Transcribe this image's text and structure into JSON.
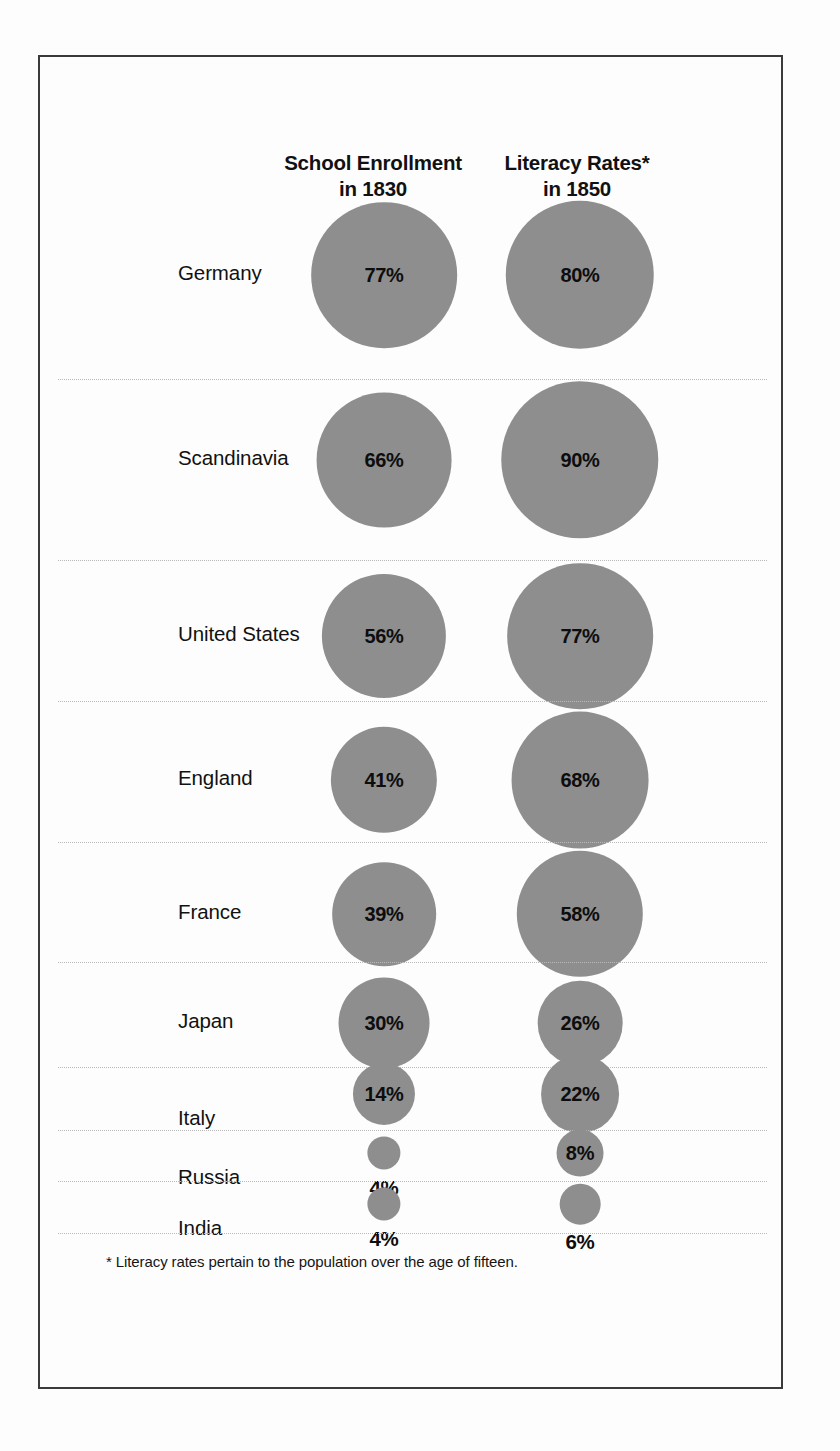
{
  "chart_data": {
    "type": "bar",
    "subtype": "bubble-matrix",
    "title": "",
    "xlabel": "",
    "ylabel": "",
    "grid": false,
    "legend_position": "none",
    "columns": [
      {
        "key": "enrollment",
        "label_line1": "School Enrollment",
        "label_line2": "in 1830",
        "unit": "%"
      },
      {
        "key": "literacy",
        "label_line1": "Literacy Rates*",
        "label_line2": "in 1850",
        "unit": "%"
      }
    ],
    "categories": [
      "Germany",
      "Scandinavia",
      "United States",
      "England",
      "France",
      "Japan",
      "Italy",
      "Russia",
      "India"
    ],
    "series": [
      {
        "name": "School Enrollment in 1830",
        "values": [
          77,
          66,
          56,
          41,
          39,
          30,
          14,
          4,
          4
        ]
      },
      {
        "name": "Literacy Rates* in 1850",
        "values": [
          80,
          90,
          77,
          68,
          58,
          26,
          22,
          8,
          6
        ]
      }
    ],
    "value_labels": {
      "enrollment": [
        "77%",
        "66%",
        "56%",
        "41%",
        "39%",
        "30%",
        "14%",
        "4%",
        "4%"
      ],
      "literacy": [
        "80%",
        "90%",
        "77%",
        "68%",
        "58%",
        "26%",
        "22%",
        "8%",
        "6%"
      ]
    },
    "annotations": [
      "* Literacy rates pertain to the population over the age of fifteen."
    ],
    "marker_color": "#8e8e8e",
    "area_encoding": "circle diameter proportional to square root of percentage"
  },
  "header": {
    "enrollment": {
      "line1": "School Enrollment",
      "line2": "in 1830"
    },
    "literacy": {
      "line1": "Literacy Rates*",
      "line2": "in 1850"
    }
  },
  "rows": [
    {
      "label": "Germany",
      "enrollment": "77%",
      "literacy": "80%"
    },
    {
      "label": "Scandinavia",
      "enrollment": "66%",
      "literacy": "90%"
    },
    {
      "label": "United States",
      "enrollment": "56%",
      "literacy": "77%"
    },
    {
      "label": "England",
      "enrollment": "41%",
      "literacy": "68%"
    },
    {
      "label": "France",
      "enrollment": "39%",
      "literacy": "58%"
    },
    {
      "label": "Japan",
      "enrollment": "30%",
      "literacy": "26%"
    },
    {
      "label": "Italy",
      "enrollment": "14%",
      "literacy": "22%"
    },
    {
      "label": "Russia",
      "enrollment": "4%",
      "literacy": "8%"
    },
    {
      "label": "India",
      "enrollment": "4%",
      "literacy": "6%"
    }
  ],
  "footnote": "* Literacy rates pertain to the population over the age of fifteen.",
  "colors": {
    "bubble": "#8e8e8e",
    "frame": "#3a3a3a",
    "separator": "#b9b9b9",
    "text": "#111111",
    "page": "#ffffff"
  }
}
